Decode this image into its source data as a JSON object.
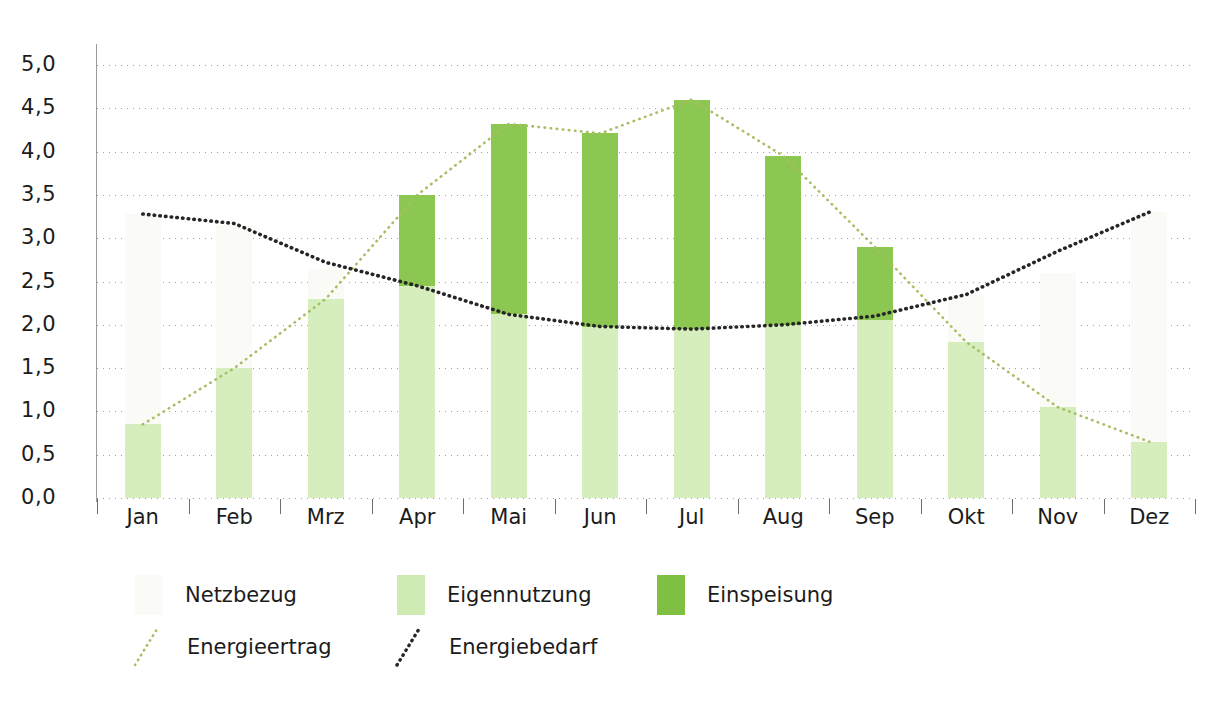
{
  "chart_data": {
    "type": "bar",
    "title": "",
    "subtitle": "",
    "xlabel": "",
    "ylabel": "",
    "ylim": [
      0.0,
      5.0
    ],
    "ytick_step": 0.5,
    "grid": "horizontal dotted",
    "legend_position": "below-plot-left",
    "categories": [
      "Jan",
      "Feb",
      "Mrz",
      "Apr",
      "Mai",
      "Jun",
      "Jul",
      "Aug",
      "Sep",
      "Okt",
      "Nov",
      "Dez"
    ],
    "ytick_labels": [
      "0,0",
      "0,5",
      "1,0",
      "1,5",
      "2,0",
      "2,5",
      "3,0",
      "3,5",
      "4,0",
      "4,5",
      "5,0"
    ],
    "ytick_values": [
      0.0,
      0.5,
      1.0,
      1.5,
      2.0,
      2.5,
      3.0,
      3.5,
      4.0,
      4.5,
      5.0
    ],
    "stacked": true,
    "series": [
      {
        "name": "Eigennutzung",
        "kind": "bar",
        "color": "#d6eebd",
        "values": [
          0.85,
          1.5,
          2.3,
          2.45,
          2.12,
          1.98,
          1.95,
          2.0,
          2.05,
          1.8,
          1.05,
          0.65
        ]
      },
      {
        "name": "Einspeisung",
        "kind": "bar",
        "color": "#8cc751",
        "values": [
          0.0,
          0.0,
          0.0,
          1.05,
          2.2,
          2.23,
          2.65,
          1.95,
          0.85,
          0.0,
          0.0,
          0.0
        ]
      },
      {
        "name": "Netzbezug",
        "kind": "bar",
        "color": "#fafaf7",
        "values": [
          2.43,
          1.65,
          0.35,
          0.0,
          0.0,
          0.0,
          0.0,
          0.0,
          0.0,
          0.55,
          1.55,
          2.65
        ]
      },
      {
        "name": "Energieertrag",
        "kind": "line",
        "style": "dotted",
        "color": "#a7bf63",
        "values": [
          0.85,
          1.5,
          2.3,
          3.5,
          4.32,
          4.21,
          4.6,
          3.95,
          2.9,
          1.8,
          1.05,
          0.65
        ]
      },
      {
        "name": "Energiebedarf",
        "kind": "line",
        "style": "dotted",
        "color": "#262626",
        "values": [
          3.28,
          3.17,
          2.72,
          2.45,
          2.12,
          1.98,
          1.95,
          2.0,
          2.1,
          2.35,
          2.85,
          3.3
        ]
      }
    ],
    "bar_totals": [
      3.28,
      3.17,
      2.65,
      3.5,
      4.32,
      4.21,
      4.6,
      3.95,
      2.9,
      2.35,
      2.6,
      3.3
    ]
  },
  "legend": {
    "row1": [
      {
        "label": "Netzbezug",
        "swatch": "netz",
        "type": "swatch",
        "color": "#fafaf7"
      },
      {
        "label": "Eigennutzung",
        "swatch": "eigen",
        "type": "swatch",
        "color": "#cfeab3"
      },
      {
        "label": "Einspeisung",
        "swatch": "eins",
        "type": "swatch",
        "color": "#7fc043"
      }
    ],
    "row2": [
      {
        "label": "Energieertrag",
        "type": "line",
        "color": "#a7bf63"
      },
      {
        "label": "Energiebedarf",
        "type": "line",
        "color": "#262626"
      }
    ]
  }
}
